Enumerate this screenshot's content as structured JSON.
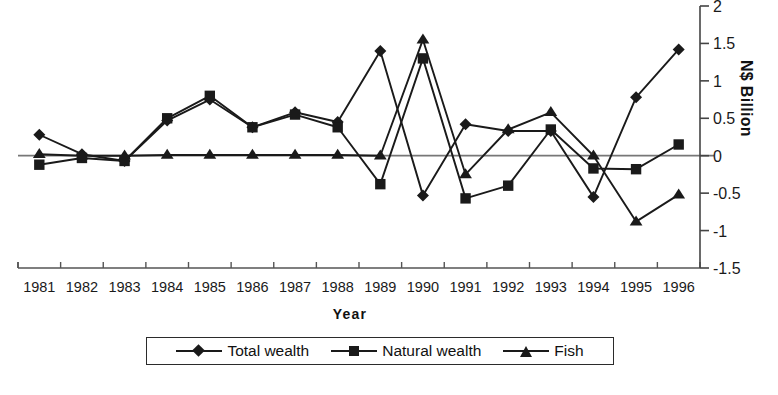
{
  "chart_data": {
    "type": "line",
    "title": "",
    "xlabel": "Year",
    "ylabel": "N$ Billion",
    "categories": [
      "1981",
      "1982",
      "1983",
      "1984",
      "1985",
      "1986",
      "1987",
      "1988",
      "1989",
      "1990",
      "1991",
      "1992",
      "1993",
      "1994",
      "1995",
      "1996"
    ],
    "ylim": [
      -1.5,
      2
    ],
    "ytick_labels": [
      "2",
      "1.5",
      "1",
      "0.5",
      "0",
      "-0.5",
      "-1",
      "-1.5"
    ],
    "ytick_values": [
      2,
      1.5,
      1,
      0.5,
      0,
      -0.5,
      -1,
      -1.5
    ],
    "grid": false,
    "legend_position": "bottom",
    "series": [
      {
        "name": "Total wealth",
        "marker": "diamond",
        "values": [
          0.28,
          0.02,
          -0.07,
          0.47,
          0.75,
          0.38,
          0.58,
          0.45,
          1.4,
          -0.53,
          0.42,
          0.33,
          0.33,
          -0.55,
          0.78,
          1.42
        ]
      },
      {
        "name": "Natural wealth",
        "marker": "square",
        "values": [
          -0.12,
          -0.03,
          -0.07,
          0.5,
          0.8,
          0.38,
          0.55,
          0.38,
          -0.38,
          1.3,
          -0.57,
          -0.4,
          0.35,
          -0.17,
          -0.18,
          0.15
        ]
      },
      {
        "name": "Fish",
        "marker": "triangle",
        "values": [
          0.02,
          0.0,
          0.0,
          0.01,
          0.01,
          0.01,
          0.01,
          0.01,
          0.0,
          1.55,
          -0.25,
          0.35,
          0.58,
          0.0,
          -0.88,
          -0.52
        ]
      }
    ]
  },
  "axis": {
    "y_title": "N$ Billion",
    "x_title": "Year"
  },
  "legend": {
    "items": [
      {
        "label": "Total wealth",
        "marker": "diamond-marker"
      },
      {
        "label": "Natural wealth",
        "marker": "square-marker"
      },
      {
        "label": "Fish",
        "marker": "triangle-marker"
      }
    ]
  },
  "footer": {
    "caption": ""
  },
  "colors": {
    "series": "#1a1a1a",
    "axis": "#4a4a4a",
    "background": "#ffffff"
  }
}
